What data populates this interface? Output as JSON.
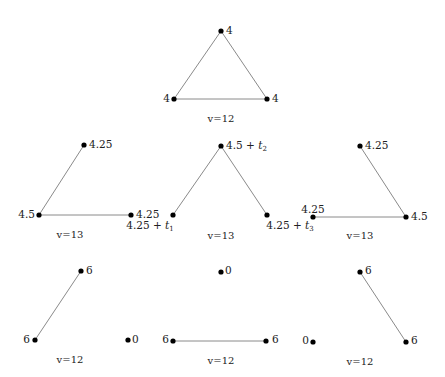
{
  "diagram": {
    "type": "graph-panels",
    "panels": [
      {
        "id": "top",
        "caption": "v=12",
        "caption_pos": [
          221,
          119
        ],
        "nodes": [
          {
            "x": 221,
            "y": 31,
            "label": "4",
            "lx": 226,
            "ly": 31,
            "anchor": "start"
          },
          {
            "x": 174,
            "y": 99,
            "label": "4",
            "lx": 170,
            "ly": 99,
            "anchor": "end"
          },
          {
            "x": 267,
            "y": 99,
            "label": "4",
            "lx": 272,
            "ly": 99,
            "anchor": "start"
          }
        ],
        "edges": [
          [
            0,
            1
          ],
          [
            0,
            2
          ],
          [
            1,
            2
          ]
        ]
      },
      {
        "id": "mid-left",
        "caption": "v=13",
        "caption_pos": [
          70,
          235
        ],
        "nodes": [
          {
            "x": 84,
            "y": 145,
            "label": "4.25",
            "lx": 89,
            "ly": 145,
            "anchor": "start"
          },
          {
            "x": 39,
            "y": 215,
            "label": "4.5",
            "lx": 35,
            "ly": 215,
            "anchor": "end"
          },
          {
            "x": 131,
            "y": 215,
            "label": "4.25",
            "lx": 136,
            "ly": 215,
            "anchor": "start"
          }
        ],
        "edges": [
          [
            0,
            1
          ],
          [
            1,
            2
          ]
        ]
      },
      {
        "id": "mid-center",
        "caption": "v=13",
        "caption_pos": [
          221,
          236
        ],
        "nodes": [
          {
            "x": 221,
            "y": 146,
            "label": "4.5 + ",
            "sub": "t",
            "subidx": "2",
            "lx": 226,
            "ly": 146,
            "anchor": "start"
          },
          {
            "x": 173,
            "y": 215,
            "label": "4.25 + ",
            "sub": "t",
            "subidx": "1",
            "lx": 150,
            "ly": 226,
            "anchor": "middle"
          },
          {
            "x": 267,
            "y": 215,
            "label": "4.25 + ",
            "sub": "t",
            "subidx": "3",
            "lx": 290,
            "ly": 226,
            "anchor": "middle"
          }
        ],
        "edges": [
          [
            0,
            1
          ],
          [
            0,
            2
          ]
        ]
      },
      {
        "id": "mid-right",
        "caption": "v=13",
        "caption_pos": [
          360,
          236
        ],
        "nodes": [
          {
            "x": 360,
            "y": 146,
            "label": "4.25",
            "lx": 365,
            "ly": 146,
            "anchor": "start"
          },
          {
            "x": 313,
            "y": 217,
            "label": "4.25",
            "lx": 313,
            "ly": 210,
            "anchor": "middle"
          },
          {
            "x": 406,
            "y": 217,
            "label": "4.5",
            "lx": 411,
            "ly": 217,
            "anchor": "start"
          }
        ],
        "edges": [
          [
            0,
            2
          ],
          [
            1,
            2
          ]
        ]
      },
      {
        "id": "bot-left",
        "caption": "v=12",
        "caption_pos": [
          70,
          360
        ],
        "nodes": [
          {
            "x": 81,
            "y": 271,
            "label": "6",
            "lx": 86,
            "ly": 271,
            "anchor": "start"
          },
          {
            "x": 35,
            "y": 340,
            "label": "6",
            "lx": 30,
            "ly": 340,
            "anchor": "end"
          },
          {
            "x": 128,
            "y": 340,
            "label": "0",
            "lx": 132,
            "ly": 340,
            "anchor": "start"
          }
        ],
        "edges": [
          [
            0,
            1
          ]
        ]
      },
      {
        "id": "bot-center",
        "caption": "v=12",
        "caption_pos": [
          221,
          361
        ],
        "nodes": [
          {
            "x": 221,
            "y": 272,
            "label": "0",
            "lx": 225,
            "ly": 271,
            "anchor": "start"
          },
          {
            "x": 173,
            "y": 341,
            "label": "6",
            "lx": 169,
            "ly": 340,
            "anchor": "end"
          },
          {
            "x": 266,
            "y": 341,
            "label": "6",
            "lx": 272,
            "ly": 340,
            "anchor": "start"
          }
        ],
        "edges": [
          [
            1,
            2
          ]
        ]
      },
      {
        "id": "bot-right",
        "caption": "v=12",
        "caption_pos": [
          360,
          362
        ],
        "nodes": [
          {
            "x": 360,
            "y": 272,
            "label": "6",
            "lx": 365,
            "ly": 271,
            "anchor": "start"
          },
          {
            "x": 313,
            "y": 342,
            "label": "0",
            "lx": 309,
            "ly": 341,
            "anchor": "end"
          },
          {
            "x": 406,
            "y": 342,
            "label": "6",
            "lx": 411,
            "ly": 341,
            "anchor": "start"
          }
        ],
        "edges": [
          [
            0,
            2
          ]
        ]
      }
    ]
  },
  "colors": {
    "edge": "#8a8a8a",
    "node": "#000000",
    "text": "#222222",
    "background": "#ffffff"
  }
}
